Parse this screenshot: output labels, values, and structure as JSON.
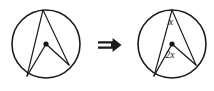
{
  "figure": {
    "background_color": "#ffffff",
    "stroke_color": "#1a1a1a",
    "width": 214,
    "height": 91
  },
  "relation": {
    "symbol": "⇒",
    "name": "implies-double-arrow"
  },
  "left_circle": {
    "name": "unlabeled-circle",
    "center": {
      "x": 46,
      "y": 44
    },
    "radius": 34,
    "center_dot_radius": 2.6,
    "points": {
      "top": {
        "x": 43,
        "y": 10
      },
      "bottom_left": {
        "x": 27,
        "y": 76
      },
      "right": {
        "x": 69,
        "y": 65
      }
    },
    "segments": [
      {
        "name": "chord-top-to-bottom-left",
        "from": "top",
        "to": "bottom_left"
      },
      {
        "name": "chord-top-to-right",
        "from": "top",
        "to": "right"
      },
      {
        "name": "radius-center-to-bottom-left",
        "from": "center",
        "to": "bottom_left"
      },
      {
        "name": "radius-center-to-right",
        "from": "center",
        "to": "right"
      }
    ]
  },
  "right_circle": {
    "name": "labeled-circle",
    "center": {
      "x": 172,
      "y": 44
    },
    "radius": 34,
    "center_dot_radius": 2.6,
    "points": {
      "top": {
        "x": 172,
        "y": 10
      },
      "bottom_left": {
        "x": 154,
        "y": 76
      },
      "right": {
        "x": 196,
        "y": 65
      }
    },
    "segments": [
      {
        "name": "chord-top-to-bottom-left",
        "from": "top",
        "to": "bottom_left"
      },
      {
        "name": "chord-top-to-right",
        "from": "top",
        "to": "right"
      },
      {
        "name": "radius-center-to-bottom-left",
        "from": "center",
        "to": "bottom_left"
      },
      {
        "name": "radius-center-to-right",
        "from": "center",
        "to": "right"
      }
    ],
    "labels": {
      "inscribed_angle": {
        "text": "x",
        "x": 171,
        "y": 23
      },
      "central_angle": {
        "text": "2x",
        "x": 170,
        "y": 56
      }
    }
  }
}
